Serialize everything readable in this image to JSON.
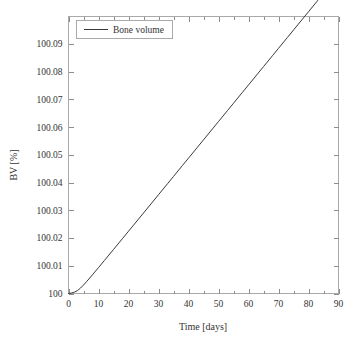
{
  "chart_data": {
    "type": "line",
    "title": "",
    "xlabel": "Time [days]",
    "ylabel": "BV [%]",
    "xlim": [
      0,
      90
    ],
    "ylim": [
      100,
      100.0999
    ],
    "grid": false,
    "legend_position": "top-left",
    "x_ticks": [
      0,
      10,
      20,
      30,
      40,
      50,
      60,
      70,
      80,
      90
    ],
    "x_tick_labels": [
      "0",
      "10",
      "20",
      "30",
      "40",
      "50",
      "60",
      "70",
      "80",
      "90"
    ],
    "x_minor_ticks": [
      5,
      15,
      25,
      35,
      45,
      55,
      65,
      75,
      85
    ],
    "y_ticks": [
      100,
      100.01,
      100.02,
      100.03,
      100.04,
      100.05,
      100.06,
      100.07,
      100.08,
      100.09
    ],
    "y_tick_labels": [
      "100",
      "100.01",
      "100.02",
      "100.03",
      "100.04",
      "100.05",
      "100.06",
      "100.07",
      "100.08",
      "100.09"
    ],
    "series": [
      {
        "name": "Bone volume",
        "color": "#3a3a3a",
        "x": [
          0,
          1,
          2,
          3,
          4,
          5,
          6,
          8,
          10,
          12,
          15,
          18,
          20,
          22,
          25,
          28,
          30,
          33,
          35,
          38,
          40,
          43,
          45,
          48,
          50,
          53,
          55,
          58,
          60,
          63,
          65,
          68,
          70,
          73,
          75,
          78,
          80,
          83,
          85,
          88,
          90
        ],
        "y": [
          100.0,
          100.00018,
          100.0005,
          100.00105,
          100.00195,
          100.00305,
          100.00425,
          100.00675,
          100.00935,
          100.01195,
          100.01588,
          100.01982,
          100.02245,
          100.02508,
          100.02903,
          100.03298,
          100.03562,
          100.03958,
          100.04222,
          100.04618,
          100.04882,
          100.05278,
          100.05542,
          100.05938,
          100.06202,
          100.06598,
          100.06862,
          100.07258,
          100.07522,
          100.07918,
          100.08182,
          100.08578,
          100.08842,
          100.09238,
          100.09502,
          100.09898,
          100.10162,
          100.10558,
          100.10822,
          100.11218,
          100.11482
        ]
      }
    ]
  },
  "legend": {
    "entries": [
      {
        "label": "Bone volume"
      }
    ]
  },
  "axes": {
    "x_title": "Time [days]",
    "y_title": "BV [%]"
  }
}
